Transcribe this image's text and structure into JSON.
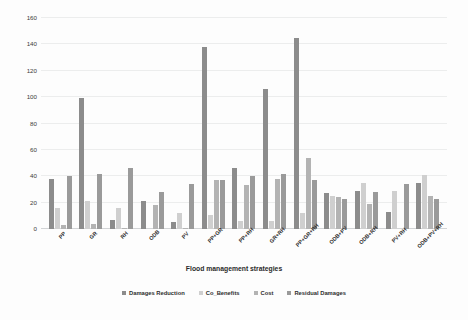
{
  "chart_data": {
    "type": "bar",
    "title": "",
    "xlabel": "Flood management strategies",
    "ylabel": "Costs, Damages and Benefits (1x10⁶)",
    "ylabel_main": "Costs, Damages and Benefits (1x10",
    "ylabel_sup": "6",
    "ylabel_tail": ")",
    "ylim": [
      0,
      160
    ],
    "ytick_step": 20,
    "yticks": [
      0,
      20,
      40,
      60,
      80,
      100,
      120,
      140,
      160
    ],
    "grid": true,
    "legend_position": "bottom",
    "categories": [
      "PP",
      "GR",
      "RH",
      "ODB",
      "PV",
      "PP+GR",
      "PP+RH",
      "GR+RH",
      "PP+GR+RH",
      "ODB+PV",
      "ODB+RH",
      "PV+RH",
      "ODB+PV+RH"
    ],
    "series": [
      {
        "name": "Damages Reduction",
        "color": "#8c8c8c",
        "values": [
          38,
          99,
          7,
          21,
          5,
          138,
          46,
          106,
          145,
          27,
          29,
          13,
          35
        ]
      },
      {
        "name": "Co_Benefits",
        "color": "#cfcfcf",
        "values": [
          16,
          21,
          16,
          0,
          12,
          11,
          6,
          6,
          12,
          25,
          35,
          29,
          41
        ]
      },
      {
        "name": "Cost",
        "color": "#b3b3b3",
        "values": [
          3,
          4,
          1,
          18,
          1,
          37,
          33,
          38,
          54,
          24,
          19,
          0,
          25
        ]
      },
      {
        "name": "Residual Damages",
        "color": "#9a9a9a",
        "values": [
          40,
          42,
          46,
          28,
          34,
          37,
          40,
          42,
          37,
          23,
          28,
          34,
          23
        ]
      }
    ]
  }
}
